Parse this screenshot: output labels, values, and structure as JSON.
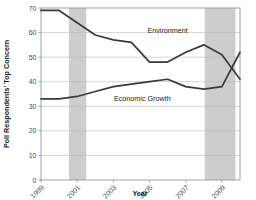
{
  "chart_data": {
    "type": "line",
    "title": "",
    "xlabel": "Year",
    "ylabel": "Poll Respondents' Top Concern",
    "xlim": [
      1999,
      2010
    ],
    "ylim": [
      0,
      70
    ],
    "ygrid": true,
    "xgrid": false,
    "legend_position": "inline-labels",
    "ytick_labels": [
      "0",
      "10",
      "20",
      "30",
      "40",
      "50",
      "60",
      "70"
    ],
    "ytick_values": [
      0,
      10,
      20,
      30,
      40,
      50,
      60,
      70
    ],
    "xtick_labels": [
      "1999",
      "2001",
      "2003",
      "2005",
      "2007",
      "2009"
    ],
    "xtick_values": [
      1999,
      2001,
      2003,
      2005,
      2007,
      2009
    ],
    "x": [
      1999,
      2000,
      2001,
      2002,
      2003,
      2004,
      2005,
      2006,
      2007,
      2008,
      2009,
      2010
    ],
    "series": [
      {
        "name": "Environment",
        "label": "Environment",
        "color": "#3a3a3a",
        "values": [
          69,
          69,
          64,
          59,
          57,
          56,
          48,
          48,
          52,
          55,
          51,
          41
        ],
        "label_x": 2006,
        "label_y": 60
      },
      {
        "name": "Economic Growth",
        "label": "Economic Growth",
        "color": "#3a3a3a",
        "values": [
          33,
          33,
          34,
          36,
          38,
          39,
          40,
          41,
          38,
          37,
          38,
          52
        ],
        "label_x": 2004.6,
        "label_y": 32
      }
    ],
    "shaded_regions": [
      {
        "name": "recession-2001",
        "x_start": 2000.55,
        "x_end": 2001.5,
        "color": "#c9c9c9"
      },
      {
        "name": "recession-2008",
        "x_start": 2008.05,
        "x_end": 2009.75,
        "color": "#c9c9c9"
      }
    ]
  }
}
